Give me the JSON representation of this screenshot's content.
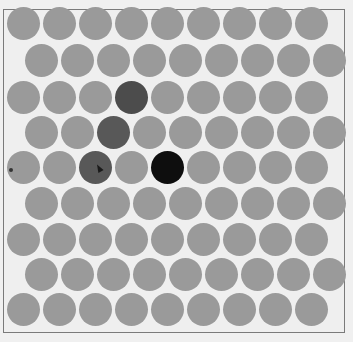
{
  "board": {
    "rows": 9,
    "cols": 9,
    "offset_rows": "odd",
    "colors": {
      "background": "#f0f0f0",
      "empty": "#9a9a9a",
      "dark": "#4c4c4c",
      "mid": "#585858",
      "black": "#0e0e0e",
      "frame": "#7a7a7a"
    },
    "highlighted": [
      {
        "row": 2,
        "col": 3,
        "state": "dark"
      },
      {
        "row": 3,
        "col": 2,
        "state": "mid"
      },
      {
        "row": 4,
        "col": 2,
        "state": "mid"
      },
      {
        "row": 4,
        "col": 4,
        "state": "black"
      }
    ],
    "marker": {
      "row": 4,
      "col": 0
    },
    "cursor": {
      "row": 4,
      "col": 2
    }
  }
}
